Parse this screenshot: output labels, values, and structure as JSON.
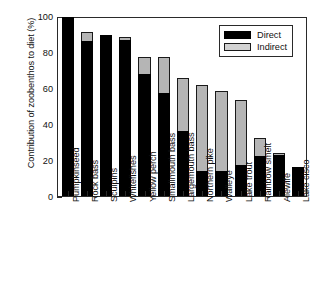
{
  "chart_data": {
    "type": "bar",
    "title": "",
    "subtitle": "",
    "xlabel": "",
    "ylabel": "Contribution of zoobenthos to diet (%)",
    "ylim": [
      0,
      100
    ],
    "yticks": [
      0,
      20,
      40,
      60,
      80,
      100
    ],
    "ytick_labels": [
      "0",
      "20",
      "40",
      "60",
      "80",
      "100"
    ],
    "grid": false,
    "stacked": true,
    "legend_position": "top-right",
    "categories": [
      "Pumpkinseed",
      "Rock bass",
      "Sculpins",
      "Whitefishes",
      "Yellow perch",
      "Smallmouth bass",
      "Largemouth bass",
      "Northern pike",
      "Walleye",
      "Lake trout",
      "Rainbow smelt",
      "Alewife",
      "Lake cisco"
    ],
    "series": [
      {
        "name": "Direct",
        "color": "#000000",
        "values": [
          99.5,
          86.0,
          89.5,
          86.5,
          68.0,
          57.0,
          36.0,
          14.0,
          14.0,
          17.5,
          22.5,
          23.0,
          16.0
        ]
      },
      {
        "name": "Indirect",
        "color": "#b5b5b5",
        "values": [
          0.0,
          5.0,
          0.0,
          2.0,
          9.5,
          20.5,
          29.5,
          47.5,
          44.5,
          36.0,
          10.0,
          1.0,
          0.0
        ]
      }
    ],
    "totals": [
      99.5,
      91.0,
      89.5,
      88.5,
      77.5,
      77.5,
      65.5,
      61.5,
      58.5,
      53.5,
      32.5,
      24.0,
      16.0
    ]
  },
  "legend": {
    "entries": [
      {
        "label": "Direct",
        "color": "#000000"
      },
      {
        "label": "Indirect",
        "color": "#d2d2d2"
      }
    ]
  }
}
